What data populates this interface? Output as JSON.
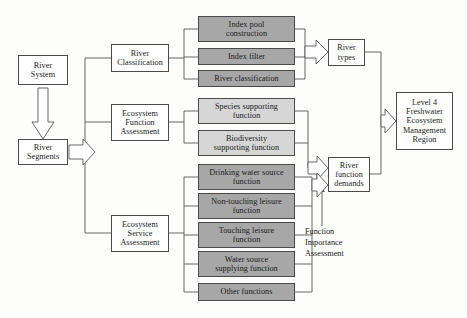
{
  "diagram": {
    "colors": {
      "box_white": "#ffffff",
      "box_light_gray": "#d6d6d6",
      "box_dark_gray": "#a7a7a7",
      "stroke": "#4a4a4a",
      "text": "#1a1a1a"
    },
    "inputs": [
      {
        "id": "river-system",
        "label": "River System",
        "lines": [
          "River",
          "System"
        ]
      },
      {
        "id": "river-segments",
        "label": "River Segments",
        "lines": [
          "River",
          "Segments"
        ]
      }
    ],
    "assessments": [
      {
        "id": "river-classification",
        "label": "River Classification",
        "lines": [
          "River",
          "Classification"
        ]
      },
      {
        "id": "ecosystem-function-assessment",
        "label": "Ecosystem Function Assessment",
        "lines": [
          "Ecosystem",
          "Function",
          "Assessment"
        ]
      },
      {
        "id": "ecosystem-service-assessment",
        "label": "Ecosystem Service Assessment",
        "lines": [
          "Ecosystem",
          "Service",
          "Assessment"
        ]
      }
    ],
    "classification_steps": [
      {
        "id": "index-pool-construction",
        "label": "Index pool construction",
        "lines": [
          "Index pool",
          "construction"
        ]
      },
      {
        "id": "index-filter",
        "label": "Index filter",
        "lines": [
          "Index filter"
        ]
      },
      {
        "id": "river-classification-step",
        "label": "River classification",
        "lines": [
          "River classification"
        ]
      }
    ],
    "function_items": [
      {
        "id": "species-supporting-function",
        "label": "Species supporting function",
        "lines": [
          "Species supporting",
          "function"
        ]
      },
      {
        "id": "biodiversity-supporting-function",
        "label": "Biodiversity supporting function",
        "lines": [
          "Biodiversity",
          "supporting function"
        ]
      }
    ],
    "service_items": [
      {
        "id": "drinking-water-source-function",
        "label": "Drinking water source function",
        "lines": [
          "Drinking  water source",
          "function"
        ]
      },
      {
        "id": "non-touching-leisure-function",
        "label": "Non-touching leisure function",
        "lines": [
          "Non-touching leisure",
          "function"
        ]
      },
      {
        "id": "touching-leisure-function",
        "label": "Touching leisure function",
        "lines": [
          "Touching leisure",
          "function"
        ]
      },
      {
        "id": "water-source-supplying-function",
        "label": "Water source supplying function",
        "lines": [
          "Water source",
          "supplying function"
        ]
      },
      {
        "id": "other-functions",
        "label": "Other functions",
        "lines": [
          "Other functions"
        ]
      }
    ],
    "outputs": [
      {
        "id": "river-types",
        "label": "River types",
        "lines": [
          "River",
          "types"
        ]
      },
      {
        "id": "river-function-demands",
        "label": "River function demands",
        "lines": [
          "River",
          "function",
          "demands"
        ]
      }
    ],
    "result": {
      "id": "level-4-freshwater-ecosystem-management-region",
      "label": "Level 4 Freshwater Ecosystem Management Region",
      "lines": [
        "Level 4",
        "Freshwater",
        "Ecosystem",
        "Management",
        "Region"
      ]
    },
    "annotations": [
      {
        "id": "function-importance-assessment",
        "label": "Function Importance Assessment",
        "lines": [
          "Function",
          "Importance",
          "Assessment"
        ]
      }
    ]
  }
}
